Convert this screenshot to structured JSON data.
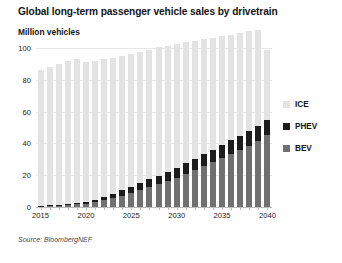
{
  "chart_data": {
    "type": "bar",
    "stacked": true,
    "title": "Global long-term passenger vehicle sales by drivetrain",
    "subtitle": "Million vehicles",
    "ylabel": "Million vehicles",
    "xlabel": "",
    "source": "Source: BloombergNEF",
    "ylim": [
      0,
      100
    ],
    "yticks": [
      0,
      20,
      40,
      60,
      80,
      100
    ],
    "xtick_labels": [
      "2015",
      "2020",
      "2025",
      "2030",
      "2035",
      "2040"
    ],
    "grid": true,
    "legend_position": "right",
    "categories": [
      "2015",
      "2016",
      "2017",
      "2018",
      "2019",
      "2020",
      "2021",
      "2022",
      "2023",
      "2024",
      "2025",
      "2026",
      "2027",
      "2028",
      "2029",
      "2030",
      "2031",
      "2032",
      "2033",
      "2034",
      "2035",
      "2036",
      "2037",
      "2038",
      "2039",
      "2040"
    ],
    "series": [
      {
        "name": "BEV",
        "color": "#707070",
        "values": [
          0.4,
          0.6,
          0.9,
          1.4,
          1.8,
          2.2,
          3.0,
          4.2,
          5.6,
          7.2,
          9.0,
          10.8,
          12.6,
          14.5,
          16.5,
          18.5,
          21.0,
          23.5,
          26.0,
          28.5,
          31.0,
          33.5,
          36.0,
          38.5,
          41.5,
          45.0
        ]
      },
      {
        "name": "PHEV",
        "color": "#1c1c1c",
        "values": [
          0.3,
          0.4,
          0.5,
          0.7,
          0.9,
          1.1,
          1.5,
          2.0,
          2.6,
          3.2,
          3.8,
          4.3,
          4.8,
          5.2,
          5.6,
          6.0,
          6.4,
          6.8,
          7.2,
          7.6,
          8.0,
          8.4,
          8.8,
          9.2,
          9.6,
          10.0
        ]
      },
      {
        "name": "ICE",
        "color": "#e3e3e3",
        "values": [
          85.3,
          87.0,
          88.6,
          89.9,
          90.3,
          87.7,
          87.5,
          86.8,
          85.8,
          84.6,
          83.2,
          82.4,
          81.6,
          80.8,
          79.4,
          78.0,
          76.1,
          74.2,
          72.3,
          70.4,
          68.5,
          66.6,
          64.7,
          62.8,
          60.4,
          44.0
        ]
      }
    ],
    "totals": [
      86.0,
      88.0,
      90.0,
      92.0,
      93.0,
      91.0,
      92.0,
      93.0,
      94.0,
      95.0,
      96.0,
      97.5,
      99.0,
      100.5,
      101.5,
      102.5,
      103.5,
      104.5,
      105.5,
      106.5,
      107.5,
      108.5,
      109.5,
      110.5,
      111.5,
      99.0
    ]
  },
  "legend": {
    "items": [
      {
        "label": "ICE",
        "color": "#e3e3e3"
      },
      {
        "label": "PHEV",
        "color": "#1c1c1c"
      },
      {
        "label": "BEV",
        "color": "#707070"
      }
    ]
  }
}
